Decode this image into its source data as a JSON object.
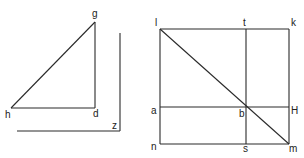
{
  "diagram": {
    "left_figure": {
      "description": "Right triangle ghd with right angle at d, plus an L-shaped reference line z",
      "points": {
        "g": {
          "label": "g",
          "x": 95,
          "y": 22,
          "lx": 92,
          "ly": 17
        },
        "h": {
          "label": "h",
          "x": 11,
          "y": 108,
          "lx": 5,
          "ly": 118
        },
        "d": {
          "label": "d",
          "x": 95,
          "y": 108,
          "lx": 93,
          "ly": 117
        },
        "z": {
          "label": "z",
          "x": 120,
          "y": 131,
          "lx": 112,
          "ly": 129
        }
      },
      "segments": [
        {
          "name": "segment-gh",
          "x1": 95,
          "y1": 22,
          "x2": 11,
          "y2": 108
        },
        {
          "name": "segment-gd",
          "x1": 95,
          "y1": 22,
          "x2": 95,
          "y2": 108
        },
        {
          "name": "segment-hd",
          "x1": 11,
          "y1": 108,
          "x2": 95,
          "y2": 108
        },
        {
          "name": "segment-z-vertical",
          "x1": 120,
          "y1": 33,
          "x2": 120,
          "y2": 131
        },
        {
          "name": "segment-z-horizontal",
          "x1": 17,
          "y1": 131,
          "x2": 120,
          "y2": 131
        }
      ]
    },
    "right_figure": {
      "description": "Square lkmn with diagonal lm, vertical ts and horizontal aH intersecting at b on the diagonal",
      "points": {
        "l": {
          "label": "l",
          "x": 160,
          "y": 29,
          "lx": 155,
          "ly": 26
        },
        "t": {
          "label": "t",
          "x": 246,
          "y": 29,
          "lx": 243,
          "ly": 26
        },
        "k": {
          "label": "k",
          "x": 289,
          "y": 29,
          "lx": 291,
          "ly": 26
        },
        "a": {
          "label": "a",
          "x": 160,
          "y": 107,
          "lx": 151,
          "ly": 114
        },
        "b": {
          "label": "b",
          "x": 246,
          "y": 107,
          "lx": 239,
          "ly": 117
        },
        "H": {
          "label": "H",
          "x": 289,
          "y": 107,
          "lx": 291,
          "ly": 114
        },
        "n": {
          "label": "n",
          "x": 160,
          "y": 144,
          "lx": 151,
          "ly": 150
        },
        "s": {
          "label": "s",
          "x": 246,
          "y": 144,
          "lx": 243,
          "ly": 152
        },
        "m": {
          "label": "m",
          "x": 289,
          "y": 144,
          "lx": 289,
          "ly": 152
        }
      },
      "segments": [
        {
          "name": "segment-lk",
          "x1": 160,
          "y1": 29,
          "x2": 289,
          "y2": 29
        },
        {
          "name": "segment-km",
          "x1": 289,
          "y1": 29,
          "x2": 289,
          "y2": 144
        },
        {
          "name": "segment-nm",
          "x1": 160,
          "y1": 144,
          "x2": 289,
          "y2": 144
        },
        {
          "name": "segment-ln",
          "x1": 160,
          "y1": 29,
          "x2": 160,
          "y2": 144
        },
        {
          "name": "segment-ts",
          "x1": 246,
          "y1": 29,
          "x2": 246,
          "y2": 144
        },
        {
          "name": "segment-aH",
          "x1": 160,
          "y1": 107,
          "x2": 289,
          "y2": 107
        },
        {
          "name": "segment-lm-diagonal",
          "x1": 160,
          "y1": 29,
          "x2": 289,
          "y2": 144
        }
      ]
    },
    "colors": {
      "line": "#2a2a2a",
      "label": "#222222",
      "background": "#ffffff"
    }
  }
}
